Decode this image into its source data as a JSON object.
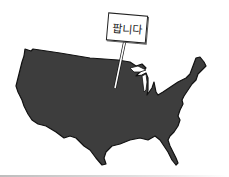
{
  "scene": {
    "description": "Illustration of the contiguous United States map with a sign planted in it",
    "sign": {
      "text": "팝니다",
      "meaning": "For Sale"
    },
    "colors": {
      "map_fill": "#3d3d3d",
      "map_outline": "#111111",
      "background": "#ffffff",
      "post": "#ffffff",
      "sign_border": "#222222"
    }
  }
}
